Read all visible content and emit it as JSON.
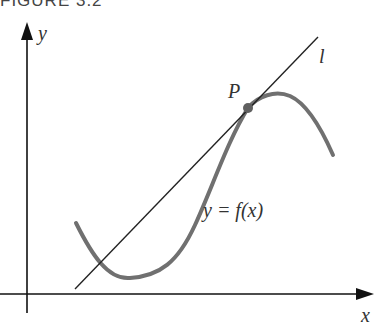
{
  "figure": {
    "caption": "FIGURE 3.2",
    "axes": {
      "x_label": "x",
      "y_label": "y"
    },
    "labels": {
      "point": "P",
      "line": "l",
      "curve": "y = f(x)"
    },
    "colors": {
      "axis": "#111111",
      "tangent_line": "#222222",
      "curve": "#707070",
      "point": "#606060"
    }
  }
}
